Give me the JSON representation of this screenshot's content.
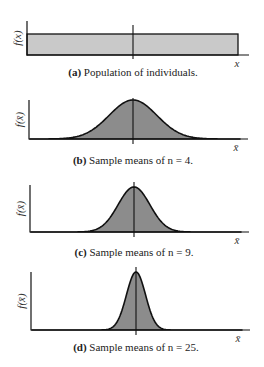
{
  "colors": {
    "uniform_fill": "#c9c9c9",
    "normal_fill": "#8c8c8c",
    "stroke": "#111111"
  },
  "chart_data": [
    {
      "type": "area",
      "panel": "a",
      "distribution": "uniform",
      "caption_label": "(a)",
      "caption_text": " Population of individuals.",
      "ylabel": "f(x)",
      "xlabel": "x",
      "relative_spread": 1.0,
      "grid": false
    },
    {
      "type": "area",
      "panel": "b",
      "distribution": "normal",
      "n": 4,
      "caption_label": "(b)",
      "caption_text": " Sample means of n = 4.",
      "ylabel": "f(x̄)",
      "xlabel": "x̄",
      "relative_spread": 0.5,
      "grid": false
    },
    {
      "type": "area",
      "panel": "c",
      "distribution": "normal",
      "n": 9,
      "caption_label": "(c)",
      "caption_text": " Sample means of n = 9.",
      "ylabel": "f(x̄)",
      "xlabel": "x̄",
      "relative_spread": 0.333,
      "grid": false
    },
    {
      "type": "area",
      "panel": "d",
      "distribution": "normal",
      "n": 25,
      "caption_label": "(d)",
      "caption_text": " Sample means of n = 25.",
      "ylabel": "f(x̄)",
      "xlabel": "x̄",
      "relative_spread": 0.2,
      "grid": false
    }
  ]
}
